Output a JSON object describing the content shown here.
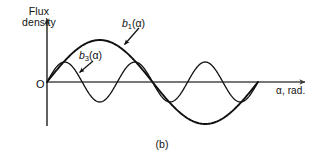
{
  "figure": {
    "caption": "(b)",
    "background_color": "#ffffff",
    "line_color": "#111111",
    "axis_color": "#555555"
  },
  "axes": {
    "y_label_line1": "Flux",
    "y_label_line2": "density",
    "x_label": "α, rad.",
    "origin_label": "O"
  },
  "curves": {
    "b1": {
      "label_base": "b",
      "label_sub": "1",
      "label_arg": "(α)",
      "label_full": "b₁(α)"
    },
    "b3": {
      "label_base": "b",
      "label_sub": "3",
      "label_arg": "(α)",
      "label_full": "b₃(α)"
    }
  },
  "chart_data": {
    "type": "line",
    "title": "",
    "subtitle": "",
    "xlabel": "α, rad.",
    "ylabel": "Flux density",
    "caption": "(b)",
    "grid": false,
    "legend": "inline-annotations",
    "xlim": [
      0,
      6.283185307179586
    ],
    "ylim": [
      -1.05,
      1.05
    ],
    "x_tick_labels": [],
    "y_tick_labels": [],
    "annotations": [
      {
        "text": "b₁(α)",
        "target_x": 1.9,
        "target_y": 0.93,
        "label_x": 2.3,
        "label_y": 1.4
      },
      {
        "text": "b₃(α)",
        "target_x": 0.72,
        "target_y": 0.4,
        "label_x": 1.05,
        "label_y": 0.72
      },
      {
        "text": "O",
        "target_x": 0.0,
        "target_y": 0.0,
        "label_x": -0.2,
        "label_y": -0.1
      }
    ],
    "series": [
      {
        "name": "b₁(α)",
        "formula": "sin(α)",
        "amplitude": 1.0,
        "harmonic": 1,
        "periods_shown": 1,
        "linewidth": 1.9,
        "x": [
          0.0,
          0.314,
          0.628,
          0.942,
          1.257,
          1.571,
          1.885,
          2.199,
          2.513,
          2.827,
          3.142,
          3.456,
          3.77,
          4.084,
          4.398,
          4.712,
          5.027,
          5.341,
          5.655,
          5.969,
          6.283
        ],
        "values": [
          0.0,
          0.309,
          0.588,
          0.809,
          0.951,
          1.0,
          0.951,
          0.809,
          0.588,
          0.309,
          0.0,
          -0.309,
          -0.588,
          -0.809,
          -0.951,
          -1.0,
          -0.951,
          -0.809,
          -0.588,
          -0.309,
          0.0
        ]
      },
      {
        "name": "b₃(α)",
        "formula": "0.48 sin(3α)",
        "amplitude": 0.48,
        "harmonic": 3,
        "periods_shown": 3,
        "linewidth": 1.3,
        "x": [
          0.0,
          0.314,
          0.628,
          0.942,
          1.257,
          1.571,
          1.885,
          2.199,
          2.513,
          2.827,
          3.142,
          3.456,
          3.77,
          4.084,
          4.398,
          4.712,
          5.027,
          5.341,
          5.655,
          5.969,
          6.283
        ],
        "values": [
          0.0,
          0.388,
          0.48,
          0.188,
          -0.282,
          -0.48,
          -0.282,
          0.188,
          0.48,
          0.388,
          0.0,
          -0.388,
          -0.48,
          -0.188,
          0.282,
          0.48,
          0.282,
          -0.188,
          -0.48,
          -0.388,
          0.0
        ]
      }
    ]
  },
  "geometry": {
    "origin_px": [
      47,
      82
    ],
    "x_axis_end_px": [
      312,
      82
    ],
    "y_axis_top_px": [
      47,
      12
    ],
    "y_axis_bottom_px": [
      47,
      126
    ],
    "x_span_px": 211,
    "b1_amplitude_px": 42,
    "b3_amplitude_px": 20
  }
}
